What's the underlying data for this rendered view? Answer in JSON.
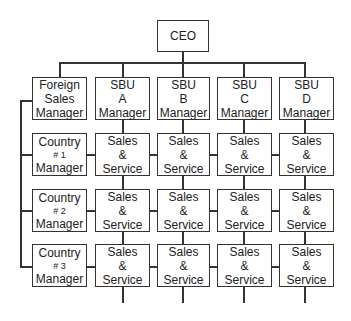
{
  "chart": {
    "root": {
      "label": "CEO"
    },
    "level1": [
      {
        "lines": [
          "Foreign",
          "Sales",
          "Manager"
        ]
      },
      {
        "lines": [
          "SBU",
          "A",
          "Manager"
        ]
      },
      {
        "lines": [
          "SBU",
          "B",
          "Manager"
        ]
      },
      {
        "lines": [
          "SBU",
          "C",
          "Manager"
        ]
      },
      {
        "lines": [
          "SBU",
          "D",
          "Manager"
        ]
      }
    ],
    "rows": [
      {
        "country": [
          "Country",
          "# 1",
          "Manager"
        ],
        "cells": [
          [
            "Sales",
            "&",
            "Service"
          ],
          [
            "Sales",
            "&",
            "Service"
          ],
          [
            "Sales",
            "&",
            "Service"
          ],
          [
            "Sales",
            "&",
            "Service"
          ]
        ]
      },
      {
        "country": [
          "Country",
          "# 2",
          "Manager"
        ],
        "cells": [
          [
            "Sales",
            "&",
            "Service"
          ],
          [
            "Sales",
            "&",
            "Service"
          ],
          [
            "Sales",
            "&",
            "Service"
          ],
          [
            "Sales",
            "&",
            "Service"
          ]
        ]
      },
      {
        "country": [
          "Country",
          "# 3",
          "Manager"
        ],
        "cells": [
          [
            "Sales",
            "&",
            "Service"
          ],
          [
            "Sales",
            "&",
            "Service"
          ],
          [
            "Sales",
            "&",
            "Service"
          ],
          [
            "Sales",
            "&",
            "Service"
          ]
        ]
      }
    ]
  },
  "colors": {
    "line": "#333333",
    "background": "#ffffff"
  }
}
